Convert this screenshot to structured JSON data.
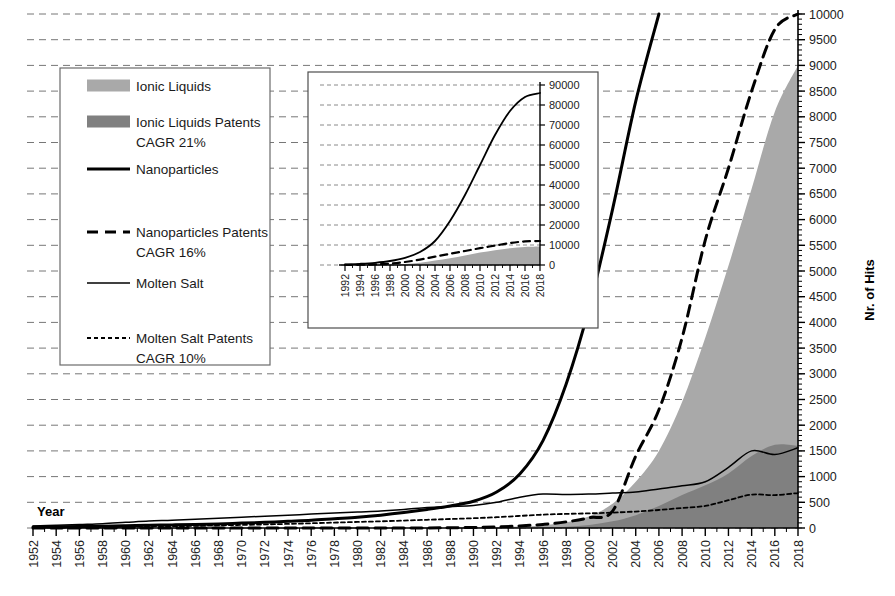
{
  "chart_data": {
    "type": "area",
    "title": "",
    "xlabel": "Year",
    "ylabel": "Nr. of Hits",
    "xlim": [
      1952,
      2018
    ],
    "ylim": [
      0,
      10000
    ],
    "ytick_step": 500,
    "xtick_step": 2,
    "grid": true,
    "yticks": [
      "0",
      "500",
      "1000",
      "1500",
      "2000",
      "2500",
      "3000",
      "3500",
      "4000",
      "4500",
      "5000",
      "5500",
      "6000",
      "6500",
      "7000",
      "7500",
      "8000",
      "8500",
      "9000",
      "9500",
      "10000"
    ],
    "xticks": [
      "1952",
      "1954",
      "1956",
      "1958",
      "1960",
      "1962",
      "1964",
      "1966",
      "1968",
      "1970",
      "1972",
      "1974",
      "1976",
      "1978",
      "1980",
      "1982",
      "1984",
      "1986",
      "1988",
      "1990",
      "1992",
      "1994",
      "1996",
      "1998",
      "2000",
      "2002",
      "2004",
      "2006",
      "2008",
      "2010",
      "2012",
      "2014",
      "2016",
      "2018"
    ],
    "x": [
      1952,
      1954,
      1956,
      1958,
      1960,
      1962,
      1964,
      1966,
      1968,
      1970,
      1972,
      1974,
      1976,
      1978,
      1980,
      1982,
      1984,
      1986,
      1988,
      1990,
      1992,
      1994,
      1996,
      1998,
      2000,
      2002,
      2004,
      2006,
      2008,
      2010,
      2012,
      2014,
      2016,
      2018
    ],
    "series": [
      {
        "name": "Ionic Liquids",
        "style": "area-light",
        "color": "#a9a9a9",
        "values": [
          0,
          0,
          0,
          0,
          0,
          0,
          0,
          0,
          0,
          0,
          0,
          0,
          0,
          0,
          0,
          0,
          0,
          0,
          5,
          10,
          20,
          30,
          50,
          110,
          230,
          470,
          900,
          1500,
          2450,
          3700,
          5100,
          6600,
          8100,
          9000
        ]
      },
      {
        "name": "Ionic Liquids Patents",
        "style": "area-dark",
        "color": "#808080",
        "cagr": "CAGR 21%",
        "values": [
          0,
          0,
          0,
          0,
          0,
          0,
          0,
          0,
          0,
          0,
          0,
          0,
          0,
          0,
          0,
          0,
          0,
          0,
          0,
          0,
          0,
          5,
          10,
          25,
          60,
          130,
          250,
          430,
          640,
          830,
          1060,
          1400,
          1620,
          1600
        ]
      },
      {
        "name": "Nanoparticles",
        "style": "line-thick",
        "color": "#000000",
        "values": [
          20,
          25,
          30,
          35,
          45,
          55,
          60,
          70,
          80,
          95,
          110,
          130,
          150,
          180,
          210,
          250,
          300,
          360,
          430,
          520,
          700,
          1050,
          1700,
          2800,
          4300,
          6200,
          8300,
          10000,
          null,
          null,
          null,
          null,
          null,
          null
        ]
      },
      {
        "name": "Nanoparticles Patents",
        "style": "line-dashed-thick",
        "color": "#000000",
        "cagr": "CAGR 16%",
        "values": [
          0,
          0,
          0,
          0,
          0,
          0,
          0,
          0,
          0,
          0,
          0,
          0,
          0,
          0,
          0,
          0,
          0,
          0,
          5,
          10,
          20,
          40,
          70,
          120,
          200,
          330,
          1400,
          2300,
          3700,
          5600,
          7000,
          8500,
          9700,
          10000
        ]
      },
      {
        "name": "Molten Salt",
        "style": "line-thin",
        "color": "#000000",
        "values": [
          40,
          55,
          70,
          85,
          110,
          135,
          150,
          170,
          190,
          210,
          230,
          250,
          270,
          290,
          310,
          330,
          360,
          400,
          420,
          440,
          500,
          600,
          660,
          650,
          660,
          680,
          700,
          760,
          820,
          900,
          1180,
          1500,
          1430,
          1560
        ]
      },
      {
        "name": "Molten Salt Patents",
        "style": "line-dotted",
        "color": "#000000",
        "cagr": "CAGR 10%",
        "values": [
          5,
          8,
          12,
          16,
          22,
          28,
          34,
          42,
          50,
          60,
          70,
          80,
          92,
          105,
          118,
          130,
          145,
          160,
          175,
          190,
          210,
          235,
          260,
          275,
          285,
          300,
          320,
          350,
          390,
          430,
          540,
          650,
          640,
          680
        ]
      }
    ],
    "inset": {
      "type": "area",
      "xlim": [
        1992,
        2018
      ],
      "ylim": [
        0,
        90000
      ],
      "ytick_step": 10000,
      "yticks": [
        "0",
        "10000",
        "20000",
        "30000",
        "40000",
        "50000",
        "60000",
        "70000",
        "80000",
        "90000"
      ],
      "xticks": [
        "1992",
        "1994",
        "1996",
        "1998",
        "2000",
        "2002",
        "2004",
        "2006",
        "2008",
        "2010",
        "2012",
        "2014",
        "2016",
        "2018"
      ],
      "x": [
        1992,
        1994,
        1996,
        1998,
        2000,
        2002,
        2004,
        2006,
        2008,
        2010,
        2012,
        2014,
        2016,
        2018
      ],
      "series": [
        {
          "name": "Nanoparticles",
          "style": "line-thin",
          "color": "#000000",
          "values": [
            300,
            600,
            1100,
            2000,
            3600,
            6500,
            12000,
            22000,
            35000,
            50000,
            65000,
            77000,
            84000,
            86000
          ]
        },
        {
          "name": "Nanoparticles Patents",
          "style": "line-dashed-thick",
          "color": "#000000",
          "values": [
            50,
            120,
            300,
            700,
            1500,
            2700,
            4200,
            5600,
            7000,
            8400,
            9700,
            11000,
            11800,
            12000
          ]
        },
        {
          "name": "Ionic Liquids",
          "style": "area-light",
          "color": "#a9a9a9",
          "values": [
            10,
            30,
            80,
            200,
            500,
            1100,
            2200,
            3400,
            4800,
            6200,
            7400,
            8400,
            9000,
            9200
          ]
        }
      ]
    }
  },
  "legend": {
    "items": [
      {
        "label": "Ionic Liquids",
        "sub": "",
        "marker": "swatch-light"
      },
      {
        "label": "Ionic Liquids Patents",
        "sub": "CAGR 21%",
        "marker": "swatch-dark"
      },
      {
        "label": "Nanoparticles",
        "sub": "",
        "marker": "line-thick"
      },
      {
        "label": "Nanoparticles Patents",
        "sub": "CAGR 16%",
        "marker": "line-dashed-thick"
      },
      {
        "label": "Molten Salt",
        "sub": "",
        "marker": "line-thin"
      },
      {
        "label": "Molten Salt Patents",
        "sub": "CAGR 10%",
        "marker": "line-dotted"
      }
    ]
  },
  "colors": {
    "light_gray": "#a9a9a9",
    "dark_gray": "#808080",
    "axis": "#000000",
    "grid": "#777777",
    "background": "#ffffff"
  }
}
